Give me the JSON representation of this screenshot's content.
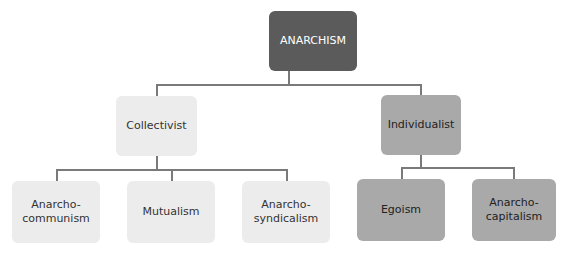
{
  "diagram": {
    "root": {
      "label": "ANARCHISM",
      "color": "#5b5b5b"
    },
    "branches": [
      {
        "label": "Collectivist",
        "color": "#ececec",
        "children": [
          {
            "label": "Anarcho-\ncommunism"
          },
          {
            "label": "Mutualism"
          },
          {
            "label": "Anarcho-\nsyndicalism"
          }
        ]
      },
      {
        "label": "Individualist",
        "color": "#a9a9a9",
        "children": [
          {
            "label": "Egoism"
          },
          {
            "label": "Anarcho-\ncapitalism"
          }
        ]
      }
    ],
    "connector_color": "#7a7a7a"
  }
}
